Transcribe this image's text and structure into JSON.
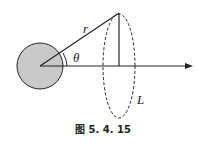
{
  "labels": {
    "r": "r",
    "theta": "θ",
    "L": "L"
  },
  "caption": "图 5. 4. 15",
  "colors": {
    "sphere_fill": "#c8c8c8",
    "stroke": "#222222"
  }
}
